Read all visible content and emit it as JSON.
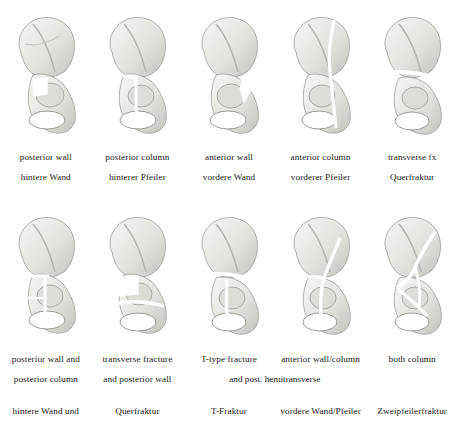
{
  "figure": {
    "background_color": "#ffffff",
    "text_color": "#1a1a1a",
    "bone_light": "#f2f2f0",
    "bone_mid": "#d8d8d5",
    "bone_shadow": "#a9a9a6",
    "bone_dark": "#8a8a87",
    "fracture_line_color": "#ffffff"
  },
  "rows": [
    {
      "name": "elementary-fractures",
      "panels": [
        {
          "illustration": "pelvis-posterior-wall-fracture",
          "english": [
            "posterior wall"
          ],
          "german": [
            "hintere Wand"
          ]
        },
        {
          "illustration": "pelvis-posterior-column-fracture",
          "english": [
            "posterior column"
          ],
          "german": [
            "hinterer Pfeiler"
          ]
        },
        {
          "illustration": "pelvis-anterior-wall-fracture",
          "english": [
            "anterior wall"
          ],
          "german": [
            "vordere Wand"
          ]
        },
        {
          "illustration": "pelvis-anterior-column-fracture",
          "english": [
            "anterior column"
          ],
          "german": [
            "vorderer Pfeiler"
          ]
        },
        {
          "illustration": "pelvis-transverse-fracture",
          "english": [
            "transverse fx"
          ],
          "german": [
            "Querfraktur"
          ]
        }
      ]
    },
    {
      "name": "associated-fractures",
      "panels": [
        {
          "illustration": "pelvis-posterior-wall-and-column-fracture",
          "english": [
            "posterior wall and",
            "posterior column"
          ],
          "german": [
            "hintere Wand und"
          ]
        },
        {
          "illustration": "pelvis-transverse-and-posterior-wall-fracture",
          "english": [
            "transverse fracture",
            "and posterior wall"
          ],
          "german": [
            "Querfraktur"
          ]
        },
        {
          "illustration": "pelvis-t-type-fracture",
          "english": [
            "T-type fracture"
          ],
          "german": [
            "T-Fraktur"
          ]
        },
        {
          "illustration": "pelvis-anterior-wall-column-hemitransverse-fracture",
          "english": [
            "anterior wall/column"
          ],
          "german": [
            "vordere Wand/Pfeiler"
          ]
        },
        {
          "illustration": "pelvis-both-column-fracture",
          "english": [
            "both column"
          ],
          "german": [
            "Zweipfeilerfraktur"
          ]
        }
      ],
      "spanning_caption": "and post. hemitransverse"
    }
  ]
}
